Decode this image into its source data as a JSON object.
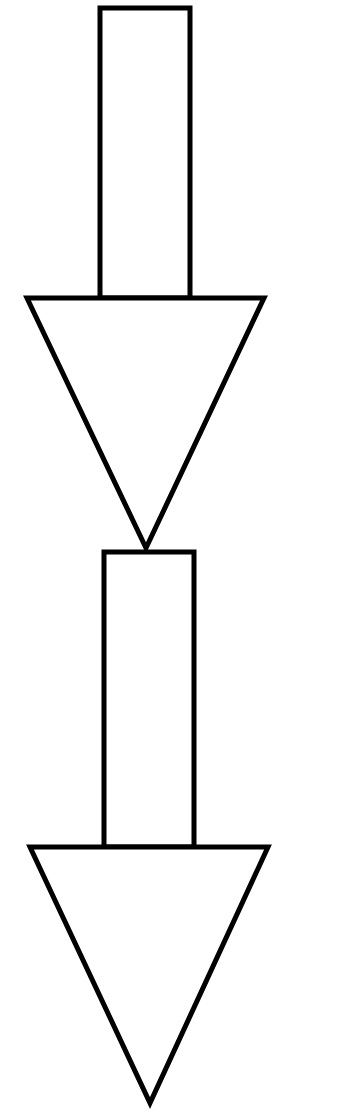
{
  "diagram": {
    "stroke_color": "#000000",
    "fill_color": "#ffffff",
    "arrows": [
      {
        "shaft": {
          "x1": 100,
          "y1": 8,
          "x2": 190,
          "y2": 298
        },
        "head": {
          "left": [
            27,
            298
          ],
          "right": [
            264,
            298
          ],
          "tip": [
            146,
            548
          ]
        }
      },
      {
        "shaft": {
          "x1": 104,
          "y1": 552,
          "x2": 194,
          "y2": 847
        },
        "head": {
          "left": [
            30,
            847
          ],
          "right": [
            268,
            847
          ],
          "tip": [
            150,
            1103
          ]
        }
      }
    ]
  }
}
